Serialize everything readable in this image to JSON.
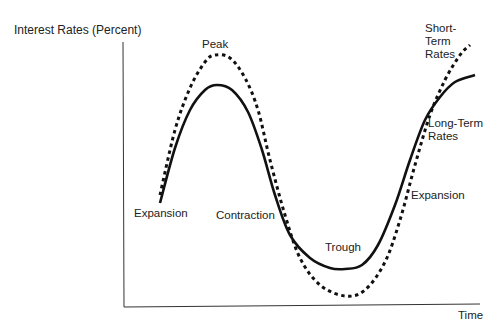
{
  "chart_data": {
    "type": "line",
    "title": "",
    "ylabel": "Interest Rates (Percent)",
    "xlabel": "Time",
    "grid": false,
    "legend": "inline labels",
    "axis_ticks": "none",
    "series": [
      {
        "name": "Short-Term Rates",
        "style": "dashed",
        "points": [
          [
            160,
            195
          ],
          [
            175,
            130
          ],
          [
            190,
            88
          ],
          [
            205,
            62
          ],
          [
            215,
            55
          ],
          [
            230,
            58
          ],
          [
            245,
            78
          ],
          [
            258,
            110
          ],
          [
            270,
            160
          ],
          [
            285,
            215
          ],
          [
            300,
            258
          ],
          [
            320,
            285
          ],
          [
            345,
            296
          ],
          [
            365,
            290
          ],
          [
            385,
            262
          ],
          [
            400,
            220
          ],
          [
            415,
            165
          ],
          [
            430,
            115
          ],
          [
            445,
            80
          ],
          [
            460,
            55
          ],
          [
            470,
            45
          ]
        ]
      },
      {
        "name": "Long-Term Rates",
        "style": "solid",
        "points": [
          [
            160,
            203
          ],
          [
            175,
            148
          ],
          [
            190,
            110
          ],
          [
            205,
            90
          ],
          [
            217,
            85
          ],
          [
            232,
            90
          ],
          [
            248,
            112
          ],
          [
            262,
            150
          ],
          [
            275,
            195
          ],
          [
            290,
            235
          ],
          [
            310,
            258
          ],
          [
            330,
            268
          ],
          [
            345,
            269
          ],
          [
            362,
            265
          ],
          [
            378,
            245
          ],
          [
            395,
            205
          ],
          [
            410,
            160
          ],
          [
            425,
            120
          ],
          [
            440,
            97
          ],
          [
            455,
            82
          ],
          [
            475,
            75
          ]
        ]
      }
    ],
    "annotations": [
      "Peak",
      "Trough",
      "Expansion",
      "Contraction",
      "Expansion"
    ]
  },
  "labels": {
    "y_axis": "Interest Rates (Percent)",
    "x_axis": "Time",
    "peak": "Peak",
    "trough": "Trough",
    "expansion_left": "Expansion",
    "contraction": "Contraction",
    "expansion_right": "Expansion",
    "short_term": "Short-Term Rates",
    "long_term": "Long-Term Rates"
  }
}
